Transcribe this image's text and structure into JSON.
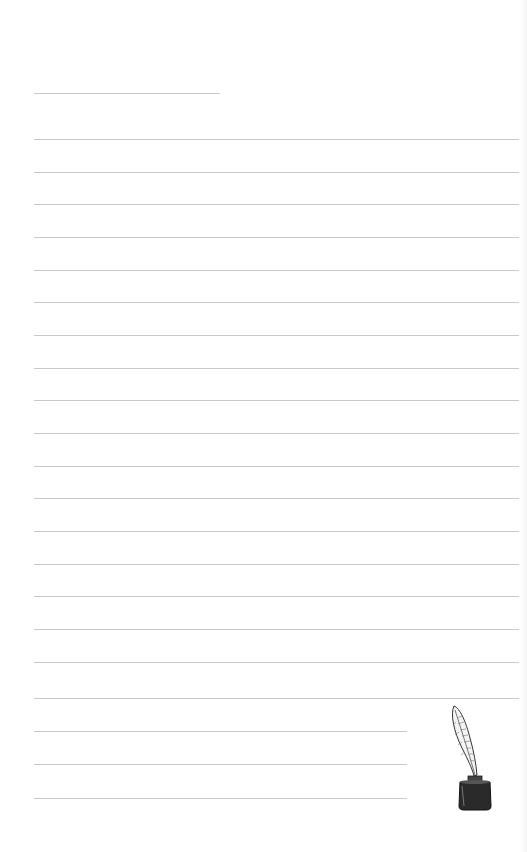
{
  "page": {
    "type": "lined-stationery",
    "background": "#ffffff",
    "line_color": "#c9c9c9",
    "title_line": {
      "x": 34,
      "y": 93,
      "width": 186
    },
    "lines": [
      {
        "y": 139,
        "x": 34,
        "width": 485
      },
      {
        "y": 172,
        "x": 34,
        "width": 485
      },
      {
        "y": 204,
        "x": 34,
        "width": 485
      },
      {
        "y": 237,
        "x": 34,
        "width": 485
      },
      {
        "y": 270,
        "x": 34,
        "width": 485
      },
      {
        "y": 302,
        "x": 34,
        "width": 485
      },
      {
        "y": 335,
        "x": 34,
        "width": 485
      },
      {
        "y": 368,
        "x": 34,
        "width": 485
      },
      {
        "y": 400,
        "x": 34,
        "width": 485
      },
      {
        "y": 433,
        "x": 34,
        "width": 485
      },
      {
        "y": 466,
        "x": 34,
        "width": 485
      },
      {
        "y": 498,
        "x": 34,
        "width": 485
      },
      {
        "y": 531,
        "x": 34,
        "width": 485
      },
      {
        "y": 564,
        "x": 34,
        "width": 485
      },
      {
        "y": 596,
        "x": 34,
        "width": 485
      },
      {
        "y": 629,
        "x": 34,
        "width": 485
      },
      {
        "y": 662,
        "x": 34,
        "width": 485
      },
      {
        "y": 698,
        "x": 34,
        "width": 485
      },
      {
        "y": 731,
        "x": 34,
        "width": 373
      },
      {
        "y": 764,
        "x": 34,
        "width": 373
      },
      {
        "y": 798,
        "x": 34,
        "width": 373
      }
    ],
    "illustration": {
      "icon": "quill-inkwell-icon"
    }
  }
}
